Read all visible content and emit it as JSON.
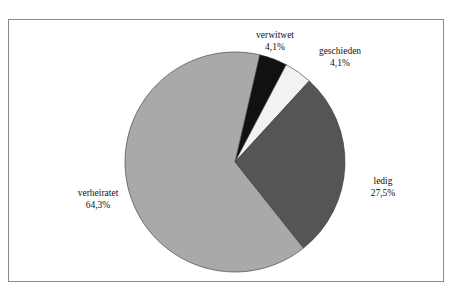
{
  "chart_data": {
    "type": "pie",
    "title": "",
    "categories": [
      "verwitwet",
      "geschieden",
      "ledig",
      "verheiratet"
    ],
    "values": [
      4.1,
      4.1,
      27.5,
      64.3
    ],
    "value_labels": [
      "4,1%",
      "4,1%",
      "27,5%",
      "64,3%"
    ],
    "colors": [
      "#111111",
      "#f2f2f2",
      "#555555",
      "#a9a9a9"
    ],
    "start_angle_deg_clockwise_from_top": 13,
    "legend": "none (direct labels)"
  },
  "labels": {
    "verwitwet": {
      "name": "verwitwet",
      "value": "4,1%"
    },
    "geschieden": {
      "name": "geschieden",
      "value": "4,1%"
    },
    "ledig": {
      "name": "ledig",
      "value": "27,5%"
    },
    "verheiratet": {
      "name": "verheiratet",
      "value": "64,3%"
    }
  }
}
